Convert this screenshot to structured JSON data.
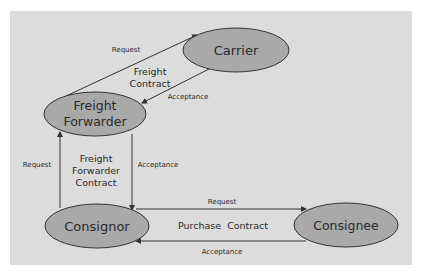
{
  "diagram": {
    "colors": {
      "background": "#dcdcdc",
      "node_fill": "#a9a9a9",
      "node_stroke": "#333333",
      "line": "#333333",
      "text": "#2a2a2a"
    },
    "nodes": {
      "carrier": {
        "label": "Carrier"
      },
      "freight_forwarder": {
        "label_line1": "Freight",
        "label_line2": "Forwarder"
      },
      "consignor": {
        "label": "Consignor"
      },
      "consignee": {
        "label": "Consignee"
      }
    },
    "contracts": {
      "freight": {
        "line1": "Freight",
        "line2": "Contract"
      },
      "freight_forwarder": {
        "line1": "Freight",
        "line2": "Forwarder",
        "line3": "Contract"
      },
      "purchase": {
        "label": "Purchase  Contract"
      }
    },
    "edges": {
      "ff_to_carrier": {
        "label": "Request"
      },
      "carrier_to_ff": {
        "label": "Acceptance"
      },
      "consignor_to_ff": {
        "label": "Request"
      },
      "ff_to_consignor": {
        "label": "Acceptance"
      },
      "consignor_to_consignee": {
        "label": "Request"
      },
      "consignee_to_consignor": {
        "label": "Acceptance"
      }
    }
  }
}
